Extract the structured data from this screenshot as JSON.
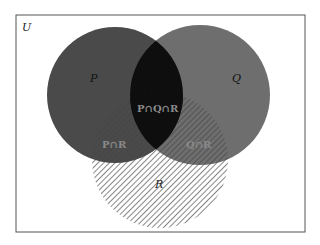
{
  "diagram": {
    "type": "venn",
    "universe_label": "U",
    "sets": [
      {
        "id": "P",
        "label": "P",
        "fill": "#4a4a4a"
      },
      {
        "id": "Q",
        "label": "Q",
        "fill": "#6e6e6e"
      },
      {
        "id": "R",
        "label": "R",
        "fill": "hatched"
      }
    ],
    "regions": [
      {
        "id": "PQR",
        "label": "P∩Q∩R"
      },
      {
        "id": "PR",
        "label": "P∩R"
      },
      {
        "id": "QR",
        "label": "Q∩R"
      }
    ],
    "colors": {
      "background": "#ffffff",
      "border": "#555555",
      "p_fill": "#4a4a4a",
      "q_fill": "#6e6e6e",
      "pq_overlap": "#0e0e0e",
      "hatch": "#555555",
      "inter_label": "#8a8a8a"
    }
  }
}
